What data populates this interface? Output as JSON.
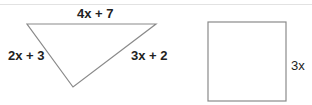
{
  "diagram": {
    "triangle": {
      "shape": "triangle",
      "sides": {
        "top": "4x + 7",
        "left": "2x + 3",
        "right": "3x + 2"
      }
    },
    "square": {
      "shape": "square",
      "side": "3x"
    },
    "colors": {
      "stroke": "#888888",
      "text": "#222222",
      "divider": "#e2e2e2"
    }
  }
}
